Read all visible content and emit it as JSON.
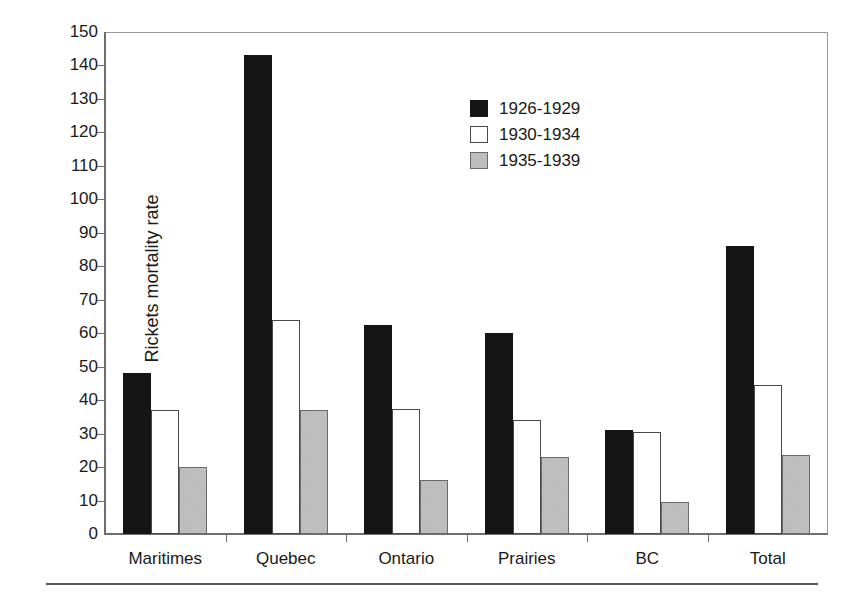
{
  "chart_data": {
    "type": "bar",
    "title": "",
    "subtitle": "",
    "xlabel": "",
    "ylabel": "Rickets mortality rate",
    "ylim": [
      0,
      150
    ],
    "ytick_step": 10,
    "yticks": [
      0,
      10,
      20,
      30,
      40,
      50,
      60,
      70,
      80,
      90,
      100,
      110,
      120,
      130,
      140,
      150
    ],
    "grid": false,
    "legend_position": "top-right-inside",
    "categories": [
      "Maritimes",
      "Quebec",
      "Ontario",
      "Prairies",
      "BC",
      "Total"
    ],
    "series": [
      {
        "name": "1926-1929",
        "color": "#151515",
        "values": [
          48,
          143,
          62.5,
          60,
          31,
          86
        ]
      },
      {
        "name": "1930-1934",
        "color": "#ffffff",
        "values": [
          37,
          64,
          37.5,
          34,
          30.5,
          44.5
        ]
      },
      {
        "name": "1935-1939",
        "color": "#c4c4c4",
        "values": [
          20,
          37,
          16,
          23,
          9.5,
          23.5
        ]
      }
    ]
  },
  "axis": {
    "y_title": "Rickets mortality rate"
  },
  "legend": {
    "entries": [
      {
        "label": "1926-1929"
      },
      {
        "label": "1930-1934"
      },
      {
        "label": "1935-1939"
      }
    ]
  }
}
